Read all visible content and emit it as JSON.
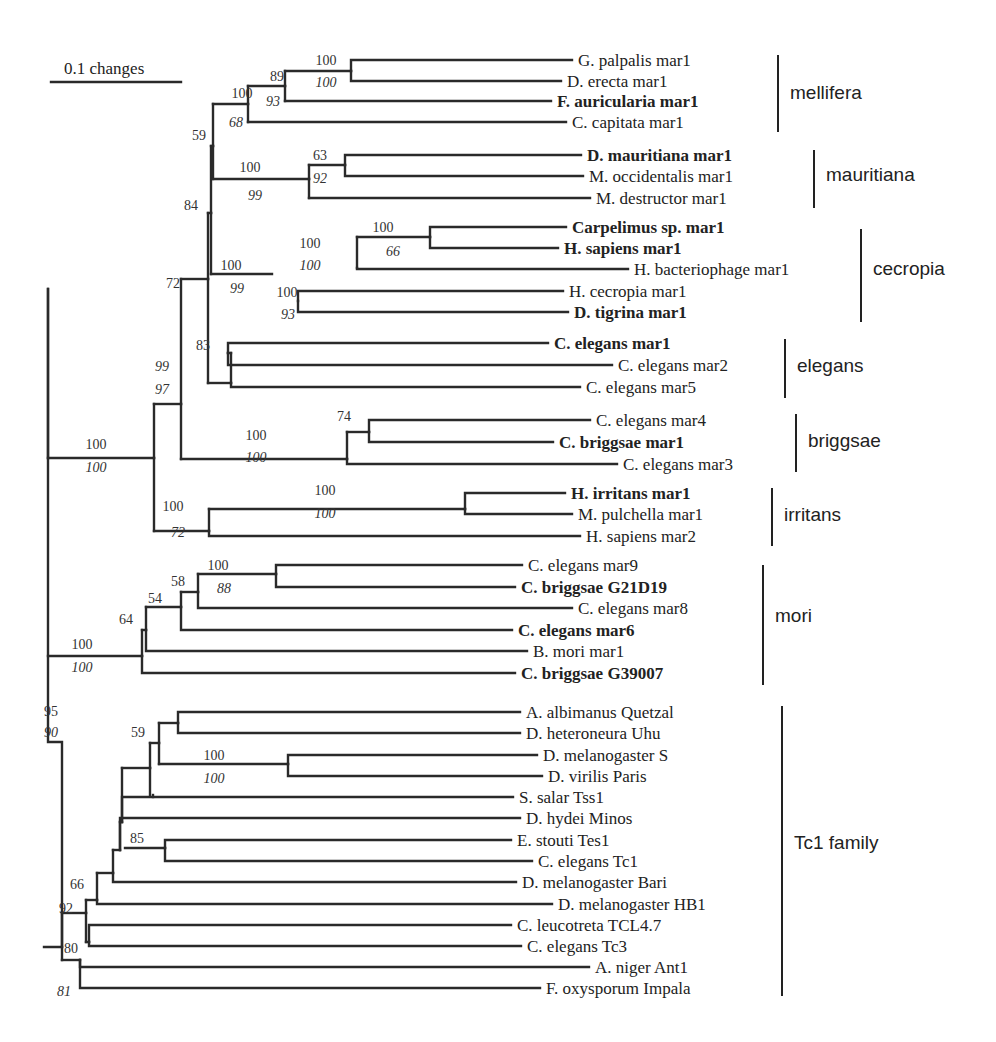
{
  "scale_bar": {
    "label": "0.1 changes",
    "x1": 51,
    "x2": 181,
    "y": 82
  },
  "leaves": [
    {
      "name": "G. palpalis mar1",
      "bold": false,
      "x_end": 572,
      "y": 60
    },
    {
      "name": "D. erecta mar1",
      "bold": false,
      "x_end": 561,
      "y": 81
    },
    {
      "name": "F. auricularia mar1",
      "bold": true,
      "x_end": 551,
      "y": 101
    },
    {
      "name": "C. capitata mar1",
      "bold": false,
      "x_end": 566,
      "y": 122
    },
    {
      "name": "D. mauritiana mar1",
      "bold": true,
      "x_end": 581,
      "y": 155
    },
    {
      "name": "M. occidentalis mar1",
      "bold": false,
      "x_end": 583,
      "y": 176
    },
    {
      "name": "M. destructor mar1",
      "bold": false,
      "x_end": 590,
      "y": 198
    },
    {
      "name": "Carpelimus sp. mar1",
      "bold": true,
      "x_end": 566,
      "y": 227
    },
    {
      "name": "H. sapiens mar1",
      "bold": true,
      "x_end": 558,
      "y": 248
    },
    {
      "name": "H. bacteriophage mar1",
      "bold": false,
      "x_end": 628,
      "y": 269
    },
    {
      "name": "H. cecropia mar1",
      "bold": false,
      "x_end": 563,
      "y": 291
    },
    {
      "name": "D. tigrina mar1",
      "bold": true,
      "x_end": 568,
      "y": 312
    },
    {
      "name": "C. elegans mar1",
      "bold": true,
      "x_end": 548,
      "y": 343
    },
    {
      "name": "C. elegans mar2",
      "bold": false,
      "x_end": 612,
      "y": 365
    },
    {
      "name": "C. elegans mar5",
      "bold": false,
      "x_end": 580,
      "y": 387
    },
    {
      "name": "C. elegans mar4",
      "bold": false,
      "x_end": 590,
      "y": 420
    },
    {
      "name": "C. briggsae mar1",
      "bold": true,
      "x_end": 553,
      "y": 442
    },
    {
      "name": "C. elegans mar3",
      "bold": false,
      "x_end": 617,
      "y": 464
    },
    {
      "name": "H. irritans mar1",
      "bold": true,
      "x_end": 565,
      "y": 493
    },
    {
      "name": "M. pulchella mar1",
      "bold": false,
      "x_end": 572,
      "y": 514
    },
    {
      "name": "H. sapiens mar2",
      "bold": false,
      "x_end": 580,
      "y": 536
    },
    {
      "name": "C. elegans mar9",
      "bold": false,
      "x_end": 522,
      "y": 565
    },
    {
      "name": "C. briggsae G21D19",
      "bold": true,
      "x_end": 515,
      "y": 587
    },
    {
      "name": "C. elegans mar8",
      "bold": false,
      "x_end": 572,
      "y": 608
    },
    {
      "name": "C. elegans mar6",
      "bold": true,
      "x_end": 512,
      "y": 630
    },
    {
      "name": "B. mori mar1",
      "bold": false,
      "x_end": 527,
      "y": 651
    },
    {
      "name": "C. briggsae G39007",
      "bold": true,
      "x_end": 515,
      "y": 673
    },
    {
      "name": "A. albimanus Quetzal",
      "bold": false,
      "x_end": 520,
      "y": 712
    },
    {
      "name": "D. heteroneura Uhu",
      "bold": false,
      "x_end": 520,
      "y": 733
    },
    {
      "name": "D. melanogaster S",
      "bold": false,
      "x_end": 537,
      "y": 755
    },
    {
      "name": "D. virilis Paris",
      "bold": false,
      "x_end": 542,
      "y": 776
    },
    {
      "name": "S. salar Tss1",
      "bold": false,
      "x_end": 513,
      "y": 797
    },
    {
      "name": "D. hydei Minos",
      "bold": false,
      "x_end": 520,
      "y": 818
    },
    {
      "name": "E. stouti Tes1",
      "bold": false,
      "x_end": 511,
      "y": 840
    },
    {
      "name": "C. elegans Tc1",
      "bold": false,
      "x_end": 532,
      "y": 861
    },
    {
      "name": "D. melanogaster Bari",
      "bold": false,
      "x_end": 516,
      "y": 882
    },
    {
      "name": "D. melanogaster HB1",
      "bold": false,
      "x_end": 552,
      "y": 904
    },
    {
      "name": "C. leucotreta TCL4.7",
      "bold": false,
      "x_end": 511,
      "y": 925
    },
    {
      "name": "C. elegans Tc3",
      "bold": false,
      "x_end": 521,
      "y": 946
    },
    {
      "name": "A. niger Ant1",
      "bold": false,
      "x_end": 589,
      "y": 967
    },
    {
      "name": "F. oxysporum Impala",
      "bold": false,
      "x_end": 540,
      "y": 988
    }
  ],
  "groups": [
    {
      "name": "mellifera",
      "bar_x": 778,
      "y1": 55,
      "y2": 132,
      "label_y": 99
    },
    {
      "name": "mauritiana",
      "bar_x": 814,
      "y1": 150,
      "y2": 208,
      "label_y": 181
    },
    {
      "name": "cecropia",
      "bar_x": 861,
      "y1": 229,
      "y2": 322,
      "label_y": 275
    },
    {
      "name": "elegans",
      "bar_x": 785,
      "y1": 339,
      "y2": 398,
      "label_y": 372
    },
    {
      "name": "briggsae",
      "bar_x": 796,
      "y1": 414,
      "y2": 472,
      "label_y": 447
    },
    {
      "name": "irritans",
      "bar_x": 772,
      "y1": 488,
      "y2": 546,
      "label_y": 521
    },
    {
      "name": "mori",
      "bar_x": 763,
      "y1": 565,
      "y2": 685,
      "label_y": 622
    },
    {
      "name": "Tc1 family",
      "bar_x": 782,
      "y1": 706,
      "y2": 996,
      "label_y": 849
    }
  ],
  "bootstrap_values": [
    {
      "text": "100",
      "italic": false,
      "x": 326,
      "y": 65
    },
    {
      "text": "100",
      "italic": true,
      "x": 326,
      "y": 87
    },
    {
      "text": "89",
      "italic": false,
      "x": 277,
      "y": 81
    },
    {
      "text": "93",
      "italic": true,
      "x": 273,
      "y": 106
    },
    {
      "text": "100",
      "italic": false,
      "x": 242,
      "y": 98
    },
    {
      "text": "68",
      "italic": true,
      "x": 236,
      "y": 127
    },
    {
      "text": "59",
      "italic": false,
      "x": 199,
      "y": 140
    },
    {
      "text": "63",
      "italic": false,
      "x": 320,
      "y": 160
    },
    {
      "text": "92",
      "italic": true,
      "x": 320,
      "y": 183
    },
    {
      "text": "100",
      "italic": false,
      "x": 250,
      "y": 172
    },
    {
      "text": "99",
      "italic": true,
      "x": 255,
      "y": 200
    },
    {
      "text": "84",
      "italic": false,
      "x": 191,
      "y": 210
    },
    {
      "text": "100",
      "italic": false,
      "x": 383,
      "y": 232
    },
    {
      "text": "66",
      "italic": true,
      "x": 393,
      "y": 256
    },
    {
      "text": "100",
      "italic": false,
      "x": 310,
      "y": 248
    },
    {
      "text": "100",
      "italic": true,
      "x": 310,
      "y": 270
    },
    {
      "text": "100",
      "italic": false,
      "x": 231,
      "y": 270
    },
    {
      "text": "99",
      "italic": true,
      "x": 237,
      "y": 293
    },
    {
      "text": "100",
      "italic": false,
      "x": 287,
      "y": 297
    },
    {
      "text": "93",
      "italic": true,
      "x": 288,
      "y": 319
    },
    {
      "text": "72",
      "italic": false,
      "x": 173,
      "y": 288
    },
    {
      "text": "83",
      "italic": false,
      "x": 203,
      "y": 350
    },
    {
      "text": "99",
      "italic": true,
      "x": 162,
      "y": 371
    },
    {
      "text": "97",
      "italic": true,
      "x": 162,
      "y": 394
    },
    {
      "text": "74",
      "italic": false,
      "x": 344,
      "y": 421
    },
    {
      "text": "100",
      "italic": false,
      "x": 256,
      "y": 440
    },
    {
      "text": "100",
      "italic": true,
      "x": 256,
      "y": 462
    },
    {
      "text": "100",
      "italic": false,
      "x": 96,
      "y": 449
    },
    {
      "text": "100",
      "italic": true,
      "x": 96,
      "y": 472
    },
    {
      "text": "100",
      "italic": false,
      "x": 325,
      "y": 495
    },
    {
      "text": "100",
      "italic": true,
      "x": 325,
      "y": 518
    },
    {
      "text": "100",
      "italic": false,
      "x": 173,
      "y": 511
    },
    {
      "text": "72",
      "italic": true,
      "x": 178,
      "y": 537
    },
    {
      "text": "100",
      "italic": false,
      "x": 218,
      "y": 570
    },
    {
      "text": "88",
      "italic": true,
      "x": 224,
      "y": 593
    },
    {
      "text": "58",
      "italic": false,
      "x": 178,
      "y": 586
    },
    {
      "text": "54",
      "italic": false,
      "x": 155,
      "y": 603
    },
    {
      "text": "64",
      "italic": false,
      "x": 126,
      "y": 624
    },
    {
      "text": "100",
      "italic": false,
      "x": 82,
      "y": 649
    },
    {
      "text": "100",
      "italic": true,
      "x": 82,
      "y": 672
    },
    {
      "text": "95",
      "italic": false,
      "x": 51,
      "y": 716
    },
    {
      "text": "90",
      "italic": true,
      "x": 51,
      "y": 737
    },
    {
      "text": "59",
      "italic": false,
      "x": 138,
      "y": 737
    },
    {
      "text": "100",
      "italic": false,
      "x": 214,
      "y": 760
    },
    {
      "text": "100",
      "italic": true,
      "x": 214,
      "y": 783
    },
    {
      "text": "85",
      "italic": false,
      "x": 137,
      "y": 843
    },
    {
      "text": "66",
      "italic": false,
      "x": 77,
      "y": 889
    },
    {
      "text": "92",
      "italic": false,
      "x": 66,
      "y": 913
    },
    {
      "text": "80",
      "italic": false,
      "x": 71,
      "y": 953
    },
    {
      "text": "81",
      "italic": true,
      "x": 64,
      "y": 996
    }
  ],
  "branches": [
    "M44,947 H62 V742 H48 V289",
    "M48,289 V458",
    "M48,458 H154",
    "M48,656 H142",
    "M154,458 V404",
    "M154,404 H181",
    "M154,458 V531",
    "M154,531 H209",
    "M181,404 V279",
    "M181,279 H208",
    "M181,404 V459",
    "M181,459 H347",
    "M208,279 V213",
    "M208,213 H211",
    "M208,279 V383",
    "M208,383 H231",
    "M211,213 V146",
    "M211,146 H213",
    "M211,213 V274",
    "M211,274 H272",
    "M213,146 V104",
    "M213,104 H248",
    "M213,146 V179",
    "M213,179 H309",
    "M248,104 V86",
    "M248,86 H285",
    "M248,104 V122",
    "M248,122 H566",
    "M285,86 V71",
    "M285,71 H351",
    "M285,86 V101",
    "M285,101 H551",
    "M351,71 V60 H572",
    "M351,71 V81 H561",
    "M309,179 V165",
    "M309,165 H345",
    "M309,179 V198",
    "M309,198 H590",
    "M345,165 V155 H581",
    "M345,165 V176 H583",
    "M357,268 V237",
    "M357,237 H430",
    "M357,268 V269 H628",
    "M430,237 V227 H566",
    "M430,237 V248 H558",
    "M298,301 V291 H563",
    "M298,301 V312 H568",
    "M231,383 V353",
    "M231,353 H228",
    "M228,353 V343 H548",
    "M228,353 V365 H612",
    "M231,383 V387 H580",
    "M347,459 V432",
    "M347,432 H369",
    "M347,459 V464 H617",
    "M369,432 V420 H590",
    "M369,432 V442 H553",
    "M209,531 V509",
    "M209,509 H465",
    "M209,531 V536 H580",
    "M465,509 V493 H565",
    "M465,509 V514 H572",
    "M142,656 V630",
    "M142,630 H146",
    "M142,656 V673 H515",
    "M146,630 V607",
    "M146,607 H181",
    "M146,630 V651 H527",
    "M181,607 V592",
    "M181,592 H198",
    "M181,607 V630 H512",
    "M198,592 V574",
    "M198,574 H276",
    "M198,592 V608 H572",
    "M276,574 V565 H522",
    "M276,574 V587 H515",
    "M62,947 V913",
    "M62,913 H86",
    "M62,947 V960",
    "M62,960 H80",
    "M80,960 V967 H589",
    "M80,960 V988 H540",
    "M86,913 V900",
    "M86,900 H97",
    "M86,913 V942",
    "M86,942 H89",
    "M89,942 V925 H511",
    "M89,942 V946 H521",
    "M97,900 V873",
    "M97,873 H113",
    "M97,900 V904 H552",
    "M113,873 V850",
    "M113,850 H120",
    "M113,873 V882 H516",
    "M120,850 V822",
    "M120,822 H122",
    "M120,850 V818 H520",
    "M122,822 V768",
    "M122,768 H150",
    "M122,822 V797 H513",
    "M125,848 H165",
    "M165,848 V840 H511",
    "M165,848 V861 H532",
    "M150,768 V743",
    "M150,743 H159",
    "M150,768 V795",
    "M159,743 V723",
    "M159,723 H178",
    "M159,743 V764",
    "M159,764 H288",
    "M178,723 V712 H520",
    "M178,723 V733 H520",
    "M288,764 V755 H537",
    "M288,764 V776 H542",
    "M153,795 V797"
  ]
}
